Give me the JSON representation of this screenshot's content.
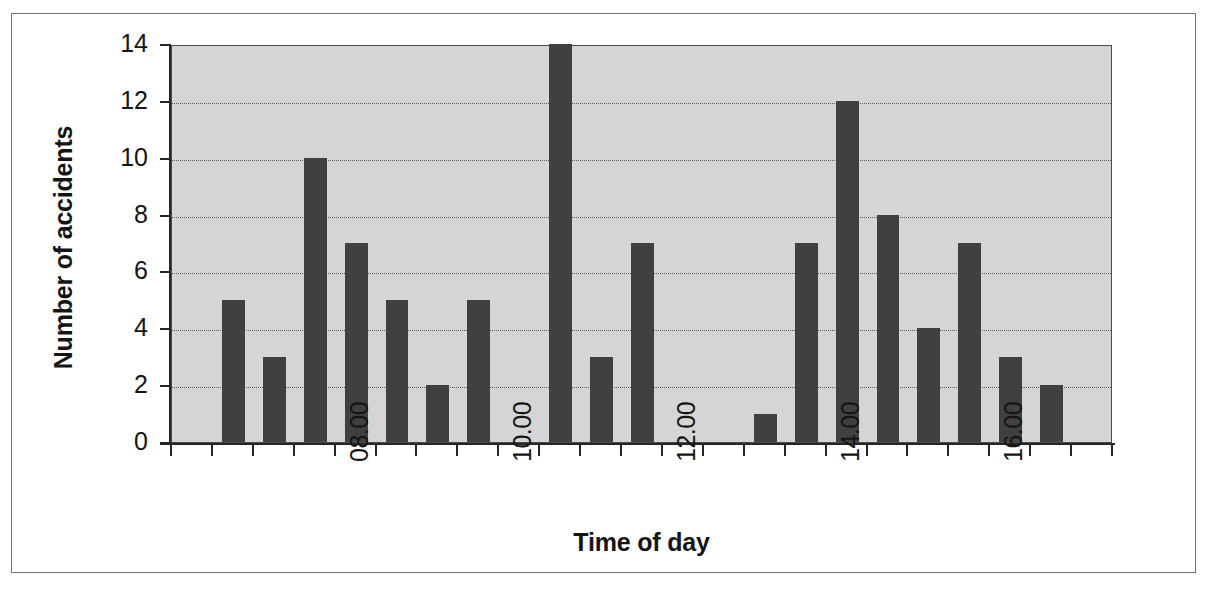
{
  "chart_data": {
    "type": "bar",
    "title": "",
    "subtitle": "",
    "xlabel": "Time of day",
    "ylabel": "Number of accidents",
    "ylim": [
      0,
      14
    ],
    "ytick_values": [
      0,
      2,
      4,
      6,
      8,
      10,
      12,
      14
    ],
    "ytick_labels": [
      "0",
      "2",
      "4",
      "6",
      "8",
      "10",
      "12",
      "14"
    ],
    "grid": "horizontal-dotted",
    "legend": "none",
    "bar_color": "#404040",
    "plot_background": "#d5d5d5",
    "page_background": "#ffffff",
    "frame_color": "#6f6f6f",
    "axis_color": "#262626",
    "xtick_labels": [
      "08.00",
      "10.00",
      "12.00",
      "14.00",
      "16.00"
    ],
    "xtick_label_rotation": 90,
    "xtick_label_positions": [
      4,
      8,
      12,
      16,
      20
    ],
    "x_minor_tick_count": 23,
    "categories": [
      "07.00",
      "07.30",
      "08.00",
      "08.30",
      "09.00",
      "09.30",
      "10.00",
      "10.30",
      "11.00",
      "11.30",
      "12.00",
      "12.30",
      "13.00",
      "13.30",
      "14.00",
      "14.30",
      "15.00",
      "15.30",
      "16.00",
      "16.30",
      "17.00"
    ],
    "values": [
      5,
      3,
      10,
      7,
      5,
      2,
      5,
      14,
      3,
      7,
      0,
      1,
      7,
      12,
      8,
      4,
      7,
      3,
      2,
      0,
      0
    ],
    "bars": [
      {
        "category": "07.00",
        "value": 5,
        "slot": 1
      },
      {
        "category": "07.30",
        "value": 3,
        "slot": 2
      },
      {
        "category": "08.00",
        "value": 10,
        "slot": 3
      },
      {
        "category": "08.30",
        "value": 7,
        "slot": 4
      },
      {
        "category": "09.00",
        "value": 5,
        "slot": 5
      },
      {
        "category": "09.30",
        "value": 2,
        "slot": 6
      },
      {
        "category": "10.00",
        "value": 5,
        "slot": 7
      },
      {
        "category": "10.30",
        "value": 14,
        "slot": 9
      },
      {
        "category": "11.00",
        "value": 3,
        "slot": 10
      },
      {
        "category": "11.30",
        "value": 7,
        "slot": 11
      },
      {
        "category": "12.30",
        "value": 1,
        "slot": 14
      },
      {
        "category": "13.00",
        "value": 7,
        "slot": 15
      },
      {
        "category": "13.30",
        "value": 12,
        "slot": 16
      },
      {
        "category": "14.00",
        "value": 8,
        "slot": 17
      },
      {
        "category": "14.30",
        "value": 4,
        "slot": 18
      },
      {
        "category": "15.00",
        "value": 7,
        "slot": 19
      },
      {
        "category": "15.30",
        "value": 3,
        "slot": 20
      },
      {
        "category": "16.00",
        "value": 2,
        "slot": 21
      }
    ]
  }
}
